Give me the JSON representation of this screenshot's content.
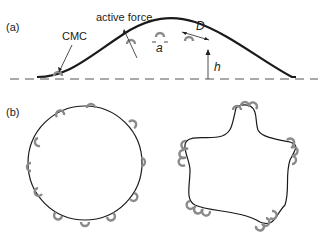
{
  "panel_a": {
    "label": "(a)",
    "cmc_label": "CMC",
    "active_force_label": "active force",
    "a_label": "a",
    "d_label": "D",
    "h_label": "h"
  },
  "panel_b": {
    "label": "(b)"
  },
  "colors": {
    "membrane": "#1a1a1a",
    "motor": "#8a8a8a",
    "baseline": "#555555",
    "text": "#222222"
  }
}
